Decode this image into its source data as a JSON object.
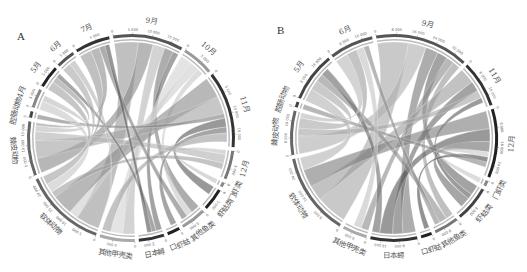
{
  "figure": {
    "panels": [
      {
        "id": "A",
        "letter": "A",
        "center": [
          131,
          138
        ],
        "radius": 104,
        "segments": [
          {
            "label": "9月",
            "value": 22,
            "shade": "#555555",
            "ticks": [
              "0",
              "5 000",
              "10 000",
              "15 000"
            ]
          },
          {
            "label": "10月",
            "value": 10,
            "shade": "#999999",
            "ticks": [
              "0",
              "5 000"
            ]
          },
          {
            "label": "11月",
            "value": 24,
            "shade": "#333333",
            "ticks": [
              "0",
              "5 000",
              "10 000",
              "15 000"
            ]
          },
          {
            "label": "12月",
            "value": 9,
            "shade": "#777777",
            "ticks": [
              "0",
              "5 000"
            ]
          },
          {
            "label": "门虾类",
            "value": 1.5,
            "shade": "#888888",
            "ticks": [
              "0"
            ]
          },
          {
            "label": "虾蛄类",
            "value": 7,
            "shade": "#222222",
            "ticks": [
              "0",
              "5 000"
            ]
          },
          {
            "label": "其他鱼类",
            "value": 8,
            "shade": "#999999",
            "ticks": [
              "0",
              "5 000"
            ]
          },
          {
            "label": "口虾蛄",
            "value": 4,
            "shade": "#222222",
            "ticks": [
              "0"
            ]
          },
          {
            "label": "日本蟳",
            "value": 8,
            "shade": "#333333",
            "ticks": [
              "0",
              "5 000"
            ]
          },
          {
            "label": "其他甲壳类",
            "value": 11,
            "shade": "#aaaaaa",
            "ticks": [
              "0",
              "5 000"
            ]
          },
          {
            "label": "软体动物",
            "value": 26,
            "shade": "#666666",
            "ticks": [
              "0",
              "5 000",
              "10 000",
              "15 000",
              "20 000"
            ]
          },
          {
            "label": "棘皮动物",
            "value": 17,
            "shade": "#666666",
            "ticks": [
              "0",
              "5 000",
              "10 000",
              "15 000"
            ]
          },
          {
            "label": "腔肠动物",
            "value": 2,
            "shade": "#444444",
            "ticks": [
              "0"
            ]
          },
          {
            "label": "4月",
            "value": 6,
            "shade": "#888888",
            "ticks": [
              "0",
              "5 000"
            ]
          },
          {
            "label": "5月",
            "value": 7,
            "shade": "#222222",
            "ticks": [
              "0",
              "5 000"
            ]
          },
          {
            "label": "6月",
            "value": 6,
            "shade": "#555555",
            "ticks": [
              "0",
              "5 000"
            ]
          },
          {
            "label": "7月",
            "value": 11,
            "shade": "#333333",
            "ticks": [
              "0",
              "5 000"
            ]
          }
        ],
        "ribbons": [
          {
            "from": 0,
            "to": 10,
            "w": 8,
            "shade": "#9a9a9a"
          },
          {
            "from": 0,
            "to": 11,
            "w": 5,
            "shade": "#8a8a8a"
          },
          {
            "from": 0,
            "to": 9,
            "w": 4,
            "shade": "#b8b8b8"
          },
          {
            "from": 0,
            "to": 6,
            "w": 3,
            "shade": "#7a7a7a"
          },
          {
            "from": 0,
            "to": 8,
            "w": 2,
            "shade": "#6a6a6a"
          },
          {
            "from": 1,
            "to": 9,
            "w": 4,
            "shade": "#d4d4d4"
          },
          {
            "from": 1,
            "to": 10,
            "w": 3,
            "shade": "#cfcfcf"
          },
          {
            "from": 1,
            "to": 6,
            "w": 2,
            "shade": "#c8c8c8"
          },
          {
            "from": 2,
            "to": 10,
            "w": 7,
            "shade": "#8c8c8c"
          },
          {
            "from": 2,
            "to": 11,
            "w": 6,
            "shade": "#a5a5a5"
          },
          {
            "from": 2,
            "to": 12,
            "w": 1.5,
            "shade": "#7f7f7f"
          },
          {
            "from": 2,
            "to": 5,
            "w": 3,
            "shade": "#5a5a5a"
          },
          {
            "from": 2,
            "to": 7,
            "w": 2,
            "shade": "#6d6d6d"
          },
          {
            "from": 2,
            "to": 9,
            "w": 3,
            "shade": "#9f9f9f"
          },
          {
            "from": 3,
            "to": 4,
            "w": 1.5,
            "shade": "#c0c0c0"
          },
          {
            "from": 3,
            "to": 11,
            "w": 3,
            "shade": "#b3b3b3"
          },
          {
            "from": 3,
            "to": 10,
            "w": 2,
            "shade": "#a0a0a0"
          },
          {
            "from": 13,
            "to": 10,
            "w": 3,
            "shade": "#c6c6c6"
          },
          {
            "from": 13,
            "to": 11,
            "w": 2,
            "shade": "#bdbdbd"
          },
          {
            "from": 14,
            "to": 10,
            "w": 3,
            "shade": "#a3a3a3"
          },
          {
            "from": 14,
            "to": 11,
            "w": 2,
            "shade": "#9b9b9b"
          },
          {
            "from": 14,
            "to": 8,
            "w": 1.5,
            "shade": "#6f6f6f"
          },
          {
            "from": 15,
            "to": 10,
            "w": 3,
            "shade": "#aaaaaa"
          },
          {
            "from": 15,
            "to": 9,
            "w": 2,
            "shade": "#b5b5b5"
          },
          {
            "from": 16,
            "to": 10,
            "w": 4,
            "shade": "#999999"
          },
          {
            "from": 16,
            "to": 11,
            "w": 3,
            "shade": "#8f8f8f"
          },
          {
            "from": 16,
            "to": 6,
            "w": 2,
            "shade": "#7a7a7a"
          },
          {
            "from": 16,
            "to": 8,
            "w": 1.5,
            "shade": "#555555"
          }
        ]
      },
      {
        "id": "B",
        "letter": "B",
        "center": [
          131,
          138
        ],
        "radius": 104,
        "segments": [
          {
            "label": "9月",
            "value": 34,
            "shade": "#555555",
            "ticks": [
              "0",
              "8 000",
              "16 000",
              "24 000",
              "32 000"
            ]
          },
          {
            "label": "11月",
            "value": 17,
            "shade": "#333333",
            "ticks": [
              "0",
              "8 000",
              "16 000"
            ]
          },
          {
            "label": "12月",
            "value": 25,
            "shade": "#222222",
            "ticks": [
              "0",
              "8 000",
              "16 000",
              "24 000"
            ]
          },
          {
            "label": "门虾类",
            "value": 2,
            "shade": "#888888",
            "ticks": [
              "0"
            ]
          },
          {
            "label": "虾蛄类",
            "value": 13,
            "shade": "#444444",
            "ticks": [
              "0",
              "8 000"
            ]
          },
          {
            "label": "其他鱼类",
            "value": 9,
            "shade": "#777777",
            "ticks": [
              "0",
              "8 000"
            ]
          },
          {
            "label": "口虾蛄",
            "value": 4,
            "shade": "#222222",
            "ticks": [
              "0"
            ]
          },
          {
            "label": "日本蟳",
            "value": 17,
            "shade": "#333333",
            "ticks": [
              "0",
              "8 000",
              "16 000"
            ]
          },
          {
            "label": "其他甲壳类",
            "value": 9,
            "shade": "#aaaaaa",
            "ticks": [
              "0",
              "8 000"
            ]
          },
          {
            "label": "软体动物",
            "value": 30,
            "shade": "#666666",
            "ticks": [
              "0",
              "8 000",
              "16 000",
              "24 000"
            ]
          },
          {
            "label": "棘皮动物",
            "value": 16,
            "shade": "#666666",
            "ticks": [
              "0",
              "8 000",
              "16 000"
            ]
          },
          {
            "label": "腔肠动物",
            "value": 2,
            "shade": "#444444",
            "ticks": [
              "0"
            ]
          },
          {
            "label": "5月",
            "value": 18,
            "shade": "#444444",
            "ticks": [
              "0",
              "8 000",
              "16 000"
            ]
          },
          {
            "label": "6月",
            "value": 16,
            "shade": "#555555",
            "ticks": [
              "0",
              "8 000",
              "16 000"
            ]
          }
        ],
        "ribbons": [
          {
            "from": 0,
            "to": 9,
            "w": 12,
            "shade": "#a8a8a8"
          },
          {
            "from": 0,
            "to": 10,
            "w": 7,
            "shade": "#b0b0b0"
          },
          {
            "from": 0,
            "to": 7,
            "w": 5,
            "shade": "#7a7a7a"
          },
          {
            "from": 0,
            "to": 4,
            "w": 4,
            "shade": "#6a6a6a"
          },
          {
            "from": 0,
            "to": 8,
            "w": 3,
            "shade": "#8c8c8c"
          },
          {
            "from": 0,
            "to": 5,
            "w": 3,
            "shade": "#999999"
          },
          {
            "from": 1,
            "to": 9,
            "w": 6,
            "shade": "#9d9d9d"
          },
          {
            "from": 1,
            "to": 7,
            "w": 4,
            "shade": "#6b6b6b"
          },
          {
            "from": 1,
            "to": 10,
            "w": 3,
            "shade": "#a6a6a6"
          },
          {
            "from": 1,
            "to": 4,
            "w": 2,
            "shade": "#5d5d5d"
          },
          {
            "from": 2,
            "to": 9,
            "w": 7,
            "shade": "#7e7e7e"
          },
          {
            "from": 2,
            "to": 7,
            "w": 5,
            "shade": "#5a5a5a"
          },
          {
            "from": 2,
            "to": 4,
            "w": 4,
            "shade": "#6f6f6f"
          },
          {
            "from": 2,
            "to": 3,
            "w": 2,
            "shade": "#c8c8c8"
          },
          {
            "from": 2,
            "to": 6,
            "w": 2,
            "shade": "#4d4d4d"
          },
          {
            "from": 2,
            "to": 11,
            "w": 2,
            "shade": "#8a8a8a"
          },
          {
            "from": 12,
            "to": 9,
            "w": 5,
            "shade": "#b5b5b5"
          },
          {
            "from": 12,
            "to": 10,
            "w": 4,
            "shade": "#aaaaaa"
          },
          {
            "from": 12,
            "to": 5,
            "w": 3,
            "shade": "#8e8e8e"
          },
          {
            "from": 12,
            "to": 7,
            "w": 3,
            "shade": "#6a6a6a"
          },
          {
            "from": 13,
            "to": 10,
            "w": 5,
            "shade": "#b9b9b9"
          },
          {
            "from": 13,
            "to": 9,
            "w": 4,
            "shade": "#a0a0a0"
          },
          {
            "from": 13,
            "to": 8,
            "w": 3,
            "shade": "#c3c3c3"
          },
          {
            "from": 13,
            "to": 5,
            "w": 2,
            "shade": "#8a8a8a"
          }
        ]
      }
    ],
    "gap_degrees": 2.2,
    "start_angle_deg": -100
  }
}
